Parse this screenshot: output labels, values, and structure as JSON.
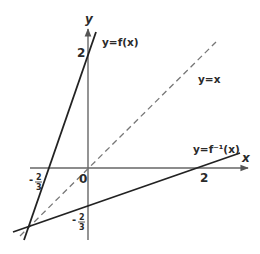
{
  "diagram": {
    "axes": {
      "x_label": "x",
      "y_label": "y",
      "origin_label": "0"
    },
    "curves": [
      {
        "id": "f",
        "label": "y=f(x)",
        "style": "solid"
      },
      {
        "id": "f_inverse",
        "label": "y=f⁻¹(x)",
        "style": "solid"
      },
      {
        "id": "identity",
        "label": "y=x",
        "style": "dashed"
      }
    ],
    "tick_labels": {
      "y_intercept_f": "2",
      "x_intercept_f_inverse": "2",
      "x_intercept_f": "-2/3",
      "y_intercept_f_inverse": "-2/3"
    },
    "fraction": {
      "sign": "-",
      "numerator": "2",
      "denominator": "3"
    }
  }
}
